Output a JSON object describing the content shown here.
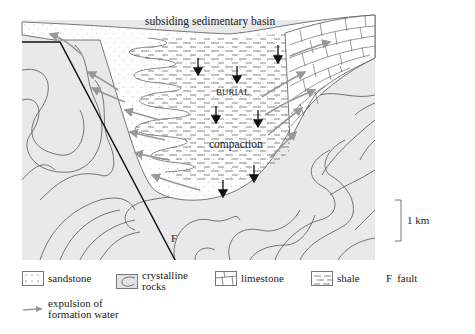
{
  "figure": {
    "labels": {
      "basin": "subsiding sedimentary basin",
      "burial": "BURIAL",
      "compaction": "compaction",
      "fault_marker": "F",
      "scale": "1 km"
    }
  },
  "legend": {
    "items": [
      {
        "key": "sandstone",
        "label": "sandstone"
      },
      {
        "key": "crystalline",
        "label_line1": "crystalline",
        "label_line2": "rocks"
      },
      {
        "key": "limestone",
        "label": "limestone"
      },
      {
        "key": "shale",
        "label": "shale"
      },
      {
        "key": "fault",
        "symbol": "F",
        "label": "fault"
      },
      {
        "key": "expulsion",
        "label_line1": "expulsion of",
        "label_line2": "formation water"
      }
    ]
  },
  "colors": {
    "crystalline_fill": "#e9e9e9",
    "basin_fill": "#ffffff",
    "lines": "#555555",
    "fault": "#111111",
    "water_arrows": "#999999",
    "burial_arrows": "#111111"
  }
}
